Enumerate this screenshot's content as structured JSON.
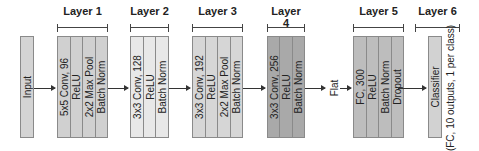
{
  "diagram": {
    "colors": {
      "input": "#d4d4d4",
      "layer1": "#d0d0d0",
      "layer2": "#e8e8e8",
      "layer3": "#d6d6d6",
      "layer4": "#a9a9a9",
      "layer5": "#bdbdbd",
      "layer6": "#d2d2d2"
    },
    "input": {
      "label": "Input"
    },
    "layers": [
      {
        "title": "Layer 1",
        "ops": [
          "5x5 Conv, 96",
          "ReLU",
          "2x2 Max Pool",
          "Batch Norm"
        ]
      },
      {
        "title": "Layer 2",
        "ops": [
          "3x3 Conv, 128",
          "ReLU",
          "Batch Norm"
        ]
      },
      {
        "title": "Layer 3",
        "ops": [
          "3x3 Conv, 192",
          "ReLU",
          "2x2 Max Pool",
          "Batch Norm"
        ]
      },
      {
        "title": "Layer 4",
        "ops": [
          "3x3 Conv, 256",
          "ReLU",
          "Batch Norm"
        ]
      },
      {
        "title": "Layer 5",
        "ops": [
          "FC, 300",
          "ReLU",
          "Batch Norm",
          "Dropout"
        ]
      },
      {
        "title": "Layer 6",
        "ops": [
          "Classifier"
        ],
        "note": "(FC, 10 outputs, 1 per class)"
      }
    ],
    "flatten_label": "Flat"
  }
}
